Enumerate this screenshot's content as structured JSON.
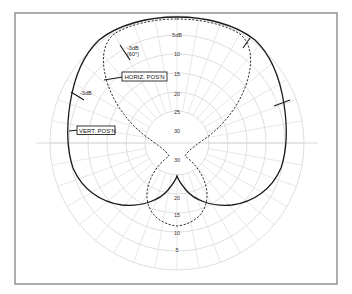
{
  "diagram": {
    "type": "polar-radiation-pattern",
    "frame": {
      "x": 15,
      "y": 13,
      "width": 322,
      "height": 271
    },
    "center": {
      "x": 177,
      "y": 143
    },
    "grid": {
      "ring_radii": [
        127,
        108,
        89,
        70,
        51,
        32
      ],
      "spoke_step_deg": 10
    },
    "ring_labels_top": [
      {
        "text": "5dB",
        "y": 37
      },
      {
        "text": "10",
        "y": 56
      },
      {
        "text": "15",
        "y": 76
      },
      {
        "text": "20",
        "y": 96
      },
      {
        "text": "25",
        "y": 114
      },
      {
        "text": "30",
        "y": 133
      }
    ],
    "ring_labels_bottom": [
      {
        "text": "30",
        "y": 162
      },
      {
        "text": "20",
        "y": 200
      },
      {
        "text": "15",
        "y": 217
      },
      {
        "text": "10",
        "y": 235
      },
      {
        "text": "5",
        "y": 252
      }
    ],
    "series": [
      {
        "name": "VERT. POS'N",
        "style": "solid"
      },
      {
        "name": "HORIZ. POS'N",
        "style": "dashed"
      }
    ],
    "annotations": {
      "minus3db_upper_line1": "-3dB",
      "minus3db_upper_line2": "(60°)",
      "minus3db_left": "-3dB"
    },
    "labels": {
      "horiz": "HORIZ. POS'N",
      "vert": "VERT. POS'N"
    },
    "colors": {
      "curve": "#1a1a1a",
      "grid": "#d6d6d6",
      "frame": "#8a8a8a"
    }
  }
}
